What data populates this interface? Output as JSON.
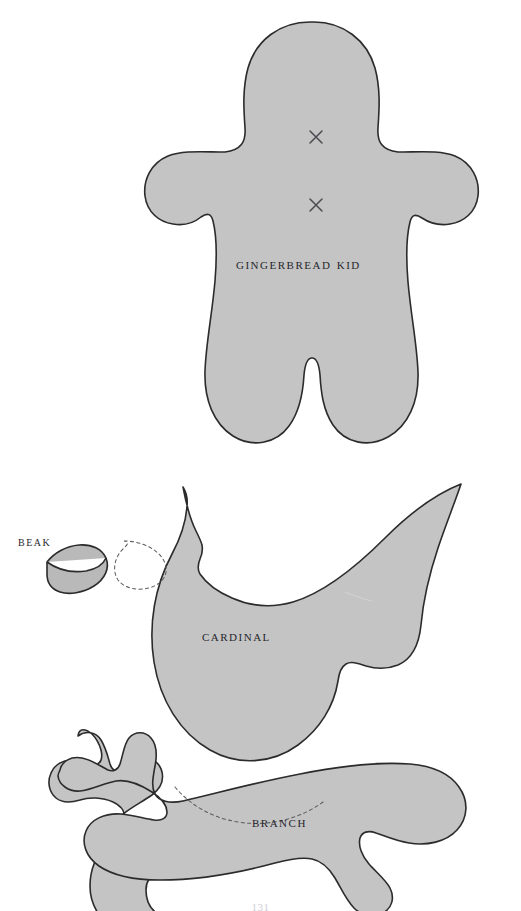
{
  "page": {
    "background_color": "#ffffff",
    "piece_fill_color": "#c4c4c4",
    "piece_outline_color": "#2b2b2b",
    "guide_line_color": "#5d5d64",
    "label_color": "#26262c",
    "page_number": "131"
  },
  "pieces": [
    {
      "id": "gingerbread-kid",
      "label": "Gingerbread Kid",
      "description": "Rounded human figure with head, two arms and two legs",
      "marks": [
        {
          "type": "x-mark",
          "name": "eye-placement-upper",
          "x": 316,
          "y": 137
        },
        {
          "type": "x-mark",
          "name": "eye-placement-lower",
          "x": 316,
          "y": 205
        }
      ]
    },
    {
      "id": "beak",
      "label": "Beak",
      "description": "Small crescent wedge piece"
    },
    {
      "id": "cardinal",
      "label": "Cardinal",
      "description": "Bird body with crest and long pointed tail",
      "guides": [
        {
          "type": "dashed-oval",
          "name": "beak-placement-guide"
        }
      ]
    },
    {
      "id": "branch",
      "label": "Branch",
      "description": "Horizontal branch with two twig offshoots",
      "guides": [
        {
          "type": "dashed-curve",
          "name": "bird-placement-guide"
        }
      ]
    }
  ]
}
